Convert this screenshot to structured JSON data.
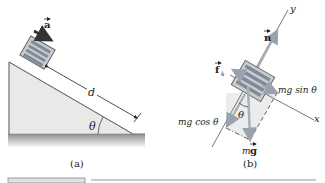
{
  "figure": {
    "panel_a": {
      "caption": "(a)",
      "acceleration_label": "a",
      "distance_label": "d",
      "angle_label": "θ"
    },
    "panel_b": {
      "caption": "(b)",
      "axis_x_label": "x",
      "axis_y_label": "y",
      "normal_label": "n",
      "friction_label": "f",
      "friction_subscript": "k",
      "mg_sin_label": "mg sin θ",
      "mg_cos_label": "mg cos θ",
      "weight_label_m": "m",
      "weight_label_g": "g",
      "angle_label": "θ"
    }
  }
}
